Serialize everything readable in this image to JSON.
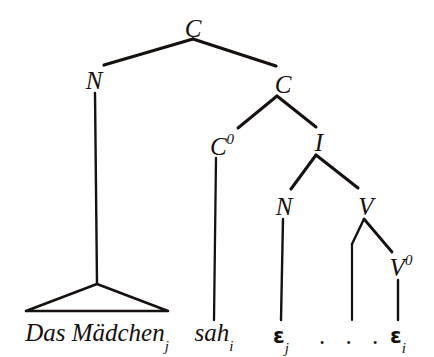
{
  "figure": {
    "type": "syntactic-tree",
    "language": "German",
    "background_color": "#ffffff",
    "ink_color": "#16110f",
    "width": 434,
    "height": 357
  },
  "nodes": {
    "root": {
      "label": "C",
      "bars": 2,
      "superscript": "",
      "x": 193,
      "y": 28
    },
    "spec_n": {
      "label": "N",
      "bars": 2,
      "superscript": "",
      "x": 94,
      "y": 80
    },
    "cbar": {
      "label": "C",
      "bars": 1,
      "superscript": "",
      "x": 283,
      "y": 84
    },
    "c_head": {
      "label": "C",
      "bars": 0,
      "superscript": "0",
      "x": 222,
      "y": 146
    },
    "ibar": {
      "label": "I",
      "bars": 2,
      "superscript": "",
      "x": 319,
      "y": 142
    },
    "subj_n": {
      "label": "N",
      "bars": 2,
      "superscript": "",
      "x": 284,
      "y": 206
    },
    "vmax": {
      "label": "V",
      "bars": 2,
      "superscript": "",
      "x": 366,
      "y": 206
    },
    "v_head": {
      "label": "V",
      "bars": 0,
      "superscript": "0",
      "x": 401,
      "y": 267
    }
  },
  "edges": [
    {
      "name": "root-to-spec-n",
      "x1": 193,
      "y1": 39,
      "x2": 104,
      "y2": 65,
      "width": 3.2
    },
    {
      "name": "root-to-cbar",
      "x1": 193,
      "y1": 39,
      "x2": 276,
      "y2": 66,
      "width": 3.2
    },
    {
      "name": "spec-n-to-np",
      "x1": 95,
      "y1": 93,
      "x2": 97,
      "y2": 284,
      "width": 2.4
    },
    {
      "name": "cbar-to-c-head",
      "x1": 277,
      "y1": 96,
      "x2": 238,
      "y2": 128,
      "width": 3.0
    },
    {
      "name": "cbar-to-ibar",
      "x1": 277,
      "y1": 96,
      "x2": 316,
      "y2": 127,
      "width": 3.0
    },
    {
      "name": "c-head-to-sah",
      "x1": 216,
      "y1": 158,
      "x2": 214,
      "y2": 320,
      "width": 2.3
    },
    {
      "name": "ibar-to-subj-n",
      "x1": 316,
      "y1": 155,
      "x2": 291,
      "y2": 189,
      "width": 3.0
    },
    {
      "name": "ibar-to-vmax",
      "x1": 316,
      "y1": 155,
      "x2": 358,
      "y2": 188,
      "width": 3.0
    },
    {
      "name": "subj-n-to-eps-j",
      "x1": 283,
      "y1": 219,
      "x2": 281,
      "y2": 320,
      "width": 2.4
    },
    {
      "name": "vmax-to-gap",
      "x1": 364,
      "y1": 219,
      "x2": 352,
      "y2": 244,
      "width": 2.4
    },
    {
      "name": "gap-to-dots",
      "x1": 352,
      "y1": 244,
      "x2": 352,
      "y2": 320,
      "width": 2.2
    },
    {
      "name": "vmax-to-v-head",
      "x1": 364,
      "y1": 219,
      "x2": 392,
      "y2": 252,
      "width": 2.8
    },
    {
      "name": "v-head-to-eps-i",
      "x1": 398,
      "y1": 280,
      "x2": 398,
      "y2": 320,
      "width": 2.4
    }
  ],
  "triangle": {
    "name": "np-triangle",
    "apex_x": 97,
    "apex_y": 284,
    "left_x": 26,
    "right_x": 168,
    "base_y": 311,
    "width": 2.6
  },
  "terminals": [
    {
      "name": "terminal-das-maedchen",
      "text": "Das Mädchen",
      "subscript": "j",
      "x": 97,
      "y": 320,
      "kind": "word"
    },
    {
      "name": "terminal-sah",
      "text": "sah",
      "subscript": "i",
      "x": 214,
      "y": 320,
      "kind": "word"
    },
    {
      "name": "terminal-trace-j",
      "text": "ε",
      "subscript": "j",
      "x": 281,
      "y": 322,
      "kind": "trace"
    },
    {
      "name": "terminal-ellipsis",
      "text": ". . .",
      "subscript": "",
      "x": 352,
      "y": 320,
      "kind": "ellipsis"
    },
    {
      "name": "terminal-trace-i",
      "text": "ε",
      "subscript": "i",
      "x": 398,
      "y": 322,
      "kind": "trace"
    }
  ]
}
